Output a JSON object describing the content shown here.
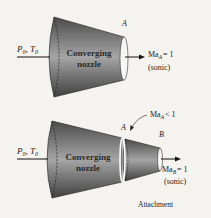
{
  "top_diagram": {
    "inlet_label": "P0, T0",
    "inlet_p": "P",
    "inlet_p_sub": "0",
    "inlet_t": "T",
    "inlet_t_sub": "0",
    "nozzle_line1": "Converging",
    "nozzle_line2": "nozzle",
    "exit_point": "A",
    "exit_mach": "Ma",
    "exit_mach_sub": "A",
    "exit_mach_value": "= 1",
    "exit_note": "(sonic)"
  },
  "bottom_diagram": {
    "inlet_p": "P",
    "inlet_p_sub": "0",
    "inlet_t": "T",
    "inlet_t_sub": "0",
    "nozzle_line1": "Converging",
    "nozzle_line2": "nozzle",
    "point_a": "A",
    "point_b": "B",
    "callout_mach": "Ma",
    "callout_mach_sub": "A",
    "callout_value": "< 1",
    "exit_mach": "Ma",
    "exit_mach_sub": "B",
    "exit_mach_value": "= 1",
    "exit_note": "(sonic)",
    "attachment_label": "Attachment"
  },
  "colors": {
    "nozzle_dark": "#555555",
    "nozzle_light": "#a8a8a8",
    "background": "#f4f3f0"
  }
}
